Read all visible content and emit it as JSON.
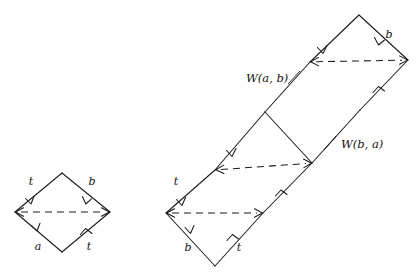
{
  "figure": {
    "title": "",
    "type": "geometric-diagram",
    "background_color": "#ffffff",
    "stroke_color": "#1a1a1a",
    "left_diagram": {
      "name": "single-square",
      "vertices": {
        "left": [
          15,
          212
        ],
        "top": [
          62,
          173
        ],
        "right": [
          110,
          212
        ],
        "bottom": [
          62,
          252
        ]
      },
      "edge_labels": [
        {
          "id": "left-top-edge",
          "text": "t",
          "x": 31,
          "y": 185
        },
        {
          "id": "top-right-edge",
          "text": "b",
          "x": 92,
          "y": 185
        },
        {
          "id": "left-bottom-edge",
          "text": "a",
          "x": 38,
          "y": 249
        },
        {
          "id": "bottom-right-edge",
          "text": "t",
          "x": 88,
          "y": 249
        }
      ],
      "diagonal": {
        "from": [
          15,
          212
        ],
        "to": [
          110,
          212
        ],
        "style": "dashed",
        "arrow": "both"
      }
    },
    "right_diagram": {
      "name": "square-chain",
      "squares": [
        {
          "id": "bottom-left-square",
          "vertices": {
            "left": [
              166,
              213
            ],
            "top": [
              215,
              170
            ],
            "right": [
              263,
              213
            ],
            "bottom": [
              215,
              266
            ]
          }
        },
        {
          "id": "middle-square",
          "vertices": {
            "left": [
              215,
              170
            ],
            "top": [
              265,
              112
            ],
            "right": [
              312,
              163
            ],
            "bottom": [
              263,
              213
            ]
          }
        },
        {
          "id": "top-right-square",
          "vertices": {
            "left": [
              310,
              62
            ],
            "top": [
              359,
              15
            ],
            "right": [
              408,
              60
            ],
            "bottom": [
              360,
              110
            ]
          }
        }
      ],
      "edge_labels": [
        {
          "id": "lower-left-t",
          "text": "t",
          "x": 176,
          "y": 184
        },
        {
          "id": "lower-b",
          "text": "b",
          "x": 188,
          "y": 250
        },
        {
          "id": "lower-right-t",
          "text": "t",
          "x": 238,
          "y": 250
        },
        {
          "id": "upper-b",
          "text": "b",
          "x": 388,
          "y": 38
        }
      ],
      "annotations": [
        {
          "id": "w-a-b-label",
          "text": "W(a, b)",
          "x": 246,
          "y": 82,
          "leader": {
            "from": [
              290,
              84
            ],
            "to": [
              303,
              72
            ]
          }
        },
        {
          "id": "w-b-a-label",
          "text": "W(b, a)",
          "x": 341,
          "y": 146,
          "leader": {
            "from": [
              324,
              148
            ],
            "to": [
              338,
              133
            ]
          }
        }
      ],
      "diagonals": [
        {
          "id": "lower-diagonal",
          "from": [
            166,
            213
          ],
          "to": [
            263,
            213
          ],
          "style": "dashed",
          "arrow": "both"
        },
        {
          "id": "middle-diagonal",
          "from": [
            215,
            170
          ],
          "to": [
            312,
            163
          ],
          "style": "dashed",
          "arrow": "both"
        },
        {
          "id": "upper-diagonal",
          "from": [
            310,
            62
          ],
          "to": [
            408,
            60
          ],
          "style": "dashed",
          "arrow": "both"
        }
      ]
    }
  }
}
